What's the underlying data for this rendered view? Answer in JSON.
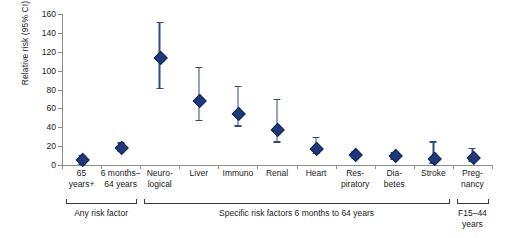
{
  "chart_data": {
    "type": "scatter",
    "title": "",
    "xlabel": "",
    "ylabel": "Relative risk (95% CI)",
    "ylim": [
      0,
      160
    ],
    "yticks": [
      0,
      20,
      40,
      60,
      80,
      100,
      120,
      140,
      160
    ],
    "grid": false,
    "legend": "none",
    "error_bar_style": "95% confidence interval",
    "marker": "diamond",
    "marker_color": "#1f3a79",
    "line_color": "#2e4a86",
    "axis_color": "#8c8c8c",
    "categories": [
      "65\nyears+",
      "6 months–\n64 years",
      "Neuro-\nlogical",
      "Liver",
      "Immuno",
      "Renal",
      "Heart",
      "Res-\npiratory",
      "Dia-\nbetes",
      "Stroke",
      "Preg-\nnancy"
    ],
    "values": [
      6,
      19,
      114,
      69,
      55,
      38,
      18,
      11,
      10,
      7,
      8
    ],
    "ci_low": [
      2,
      15,
      82,
      48,
      42,
      25,
      13,
      8,
      7,
      3,
      5
    ],
    "ci_high": [
      11,
      24,
      152,
      104,
      84,
      70,
      30,
      15,
      14,
      25,
      18
    ],
    "groups": [
      {
        "label": "Any risk factor",
        "start": 0,
        "end": 1
      },
      {
        "label": "Specific risk factors 6 months to 64 years",
        "start": 2,
        "end": 9
      },
      {
        "label": "F15–44\nyears",
        "start": 10,
        "end": 10
      }
    ]
  }
}
